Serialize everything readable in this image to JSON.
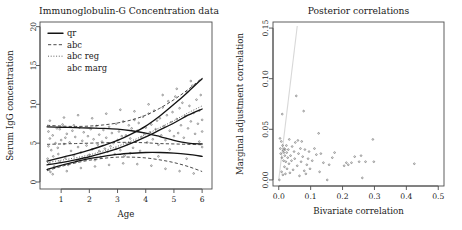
{
  "figure": {
    "background": "#ffffff",
    "axis_color": "#4d4d4d",
    "point_color": "#555555",
    "curve_color": "#141414",
    "faint_line_color": "#d8d8d8"
  },
  "chart_data": [
    {
      "type": "scatter",
      "title": "Immunoglobulin-G Concentration data",
      "xlabel": "Age",
      "ylabel": "Serum IgG concentration",
      "xlim": [
        0.25,
        6.35
      ],
      "ylim": [
        -0.9,
        20.6
      ],
      "xticks": [
        "1",
        "2",
        "3",
        "4",
        "5",
        "6"
      ],
      "xtick_values": [
        1,
        2,
        3,
        4,
        5,
        6
      ],
      "yticks": [
        "0",
        "5",
        "10",
        "15",
        "20"
      ],
      "ytick_values": [
        0,
        5,
        10,
        15,
        20
      ],
      "grid": false,
      "legend_position": "top-left",
      "legend": [
        {
          "label": "qr",
          "style": "solid"
        },
        {
          "label": "abc",
          "style": "dashed"
        },
        {
          "label": "abc reg",
          "style": "dotted"
        },
        {
          "label": "abc marg",
          "style": "none"
        }
      ],
      "series": [
        {
          "name": "qr upper quantile",
          "style": "solid",
          "x": [
            0.5,
            1.0,
            1.5,
            2.0,
            2.5,
            3.0,
            3.5,
            4.0,
            4.5,
            5.0,
            5.5,
            6.0
          ],
          "values": [
            2.7,
            3.15,
            3.6,
            4.1,
            4.7,
            5.35,
            6.2,
            7.2,
            8.5,
            10.0,
            11.6,
            13.3
          ]
        },
        {
          "name": "qr median",
          "style": "solid",
          "x": [
            0.5,
            1.0,
            1.5,
            2.0,
            2.5,
            3.0,
            3.5,
            4.0,
            4.5,
            5.0,
            5.5,
            6.0
          ],
          "values": [
            2.2,
            2.5,
            2.85,
            3.25,
            3.75,
            4.3,
            5.0,
            5.8,
            6.7,
            7.6,
            8.6,
            9.4
          ]
        },
        {
          "name": "qr upper flat",
          "style": "solid",
          "x": [
            0.5,
            1.0,
            1.5,
            2.0,
            2.5,
            3.0,
            3.5,
            4.0,
            4.5,
            5.0,
            5.5,
            6.0
          ],
          "values": [
            7.1,
            7.05,
            7.0,
            6.95,
            6.9,
            6.8,
            6.6,
            6.3,
            5.85,
            5.35,
            5.0,
            4.9
          ]
        },
        {
          "name": "qr lower flat",
          "style": "solid",
          "x": [
            0.5,
            1.0,
            1.5,
            2.0,
            2.5,
            3.0,
            3.5,
            4.0,
            4.5,
            5.0,
            5.5,
            6.0
          ],
          "values": [
            1.6,
            2.15,
            2.6,
            3.0,
            3.3,
            3.55,
            3.7,
            3.8,
            3.8,
            3.72,
            3.55,
            3.3
          ]
        },
        {
          "name": "abc upper band",
          "style": "dashed",
          "x": [
            0.5,
            1.0,
            1.5,
            2.0,
            2.5,
            3.0,
            3.5,
            4.0,
            4.5,
            5.0,
            5.5,
            6.0
          ],
          "values": [
            7.3,
            7.2,
            7.15,
            7.2,
            7.35,
            7.6,
            8.0,
            8.6,
            9.5,
            10.6,
            11.9,
            13.4
          ]
        },
        {
          "name": "abc mid band",
          "style": "dashed",
          "x": [
            0.5,
            1.0,
            1.5,
            2.0,
            2.5,
            3.0,
            3.5,
            4.0,
            4.5,
            5.0,
            5.5,
            6.0
          ],
          "values": [
            4.85,
            4.9,
            4.95,
            5.0,
            5.05,
            5.1,
            5.1,
            5.05,
            4.95,
            4.9,
            4.85,
            4.8
          ]
        },
        {
          "name": "abc lower band",
          "style": "dashed",
          "x": [
            0.5,
            1.0,
            1.5,
            2.0,
            2.5,
            3.0,
            3.5,
            4.0,
            4.5,
            5.0,
            5.5,
            6.0
          ],
          "values": [
            1.45,
            2.0,
            2.45,
            2.8,
            3.05,
            3.2,
            3.2,
            3.1,
            2.85,
            2.5,
            2.0,
            1.35
          ]
        },
        {
          "name": "abc reg band",
          "style": "dotted",
          "x": [
            0.5,
            1.0,
            1.5,
            2.0,
            2.5,
            3.0,
            3.5,
            4.0,
            4.5,
            5.0,
            5.5,
            6.0
          ],
          "values": [
            2.5,
            2.8,
            3.1,
            3.5,
            4.0,
            4.6,
            5.3,
            6.1,
            7.0,
            7.9,
            8.9,
            9.8
          ]
        }
      ],
      "points": [
        [
          0.52,
          3.0
        ],
        [
          0.55,
          4.6
        ],
        [
          0.58,
          2.4
        ],
        [
          0.6,
          5.6
        ],
        [
          0.62,
          1.3
        ],
        [
          0.65,
          4.1
        ],
        [
          0.7,
          6.0
        ],
        [
          0.72,
          3.3
        ],
        [
          0.75,
          2.0
        ],
        [
          0.8,
          5.0
        ],
        [
          0.85,
          6.9
        ],
        [
          0.88,
          4.4
        ],
        [
          0.9,
          3.6
        ],
        [
          0.95,
          2.6
        ],
        [
          1.0,
          5.4
        ],
        [
          1.05,
          7.4
        ],
        [
          1.1,
          4.9
        ],
        [
          1.15,
          3.1
        ],
        [
          1.2,
          6.2
        ],
        [
          1.25,
          2.2
        ],
        [
          1.3,
          5.1
        ],
        [
          1.35,
          4.0
        ],
        [
          1.4,
          6.6
        ],
        [
          1.45,
          3.4
        ],
        [
          1.5,
          5.8
        ],
        [
          1.55,
          2.7
        ],
        [
          1.6,
          4.5
        ],
        [
          1.65,
          7.0
        ],
        [
          1.7,
          3.8
        ],
        [
          1.75,
          5.3
        ],
        [
          1.8,
          6.4
        ],
        [
          1.85,
          2.9
        ],
        [
          1.9,
          4.7
        ],
        [
          1.95,
          5.9
        ],
        [
          2.0,
          3.5
        ],
        [
          2.05,
          6.8
        ],
        [
          2.1,
          4.2
        ],
        [
          2.15,
          5.5
        ],
        [
          2.2,
          2.8
        ],
        [
          2.25,
          7.2
        ],
        [
          2.3,
          4.8
        ],
        [
          2.35,
          6.1
        ],
        [
          2.4,
          3.2
        ],
        [
          2.45,
          5.2
        ],
        [
          2.5,
          6.7
        ],
        [
          2.55,
          4.3
        ],
        [
          2.6,
          5.7
        ],
        [
          2.65,
          3.9
        ],
        [
          2.7,
          7.1
        ],
        [
          2.75,
          4.6
        ],
        [
          2.8,
          6.3
        ],
        [
          2.85,
          5.0
        ],
        [
          2.9,
          3.6
        ],
        [
          2.95,
          7.5
        ],
        [
          3.0,
          5.4
        ],
        [
          3.05,
          6.5
        ],
        [
          3.1,
          4.1
        ],
        [
          3.15,
          5.9
        ],
        [
          3.2,
          7.8
        ],
        [
          3.25,
          3.4
        ],
        [
          3.3,
          6.0
        ],
        [
          3.35,
          4.9
        ],
        [
          3.4,
          7.3
        ],
        [
          3.45,
          5.6
        ],
        [
          3.5,
          6.9
        ],
        [
          3.55,
          4.4
        ],
        [
          3.6,
          8.0
        ],
        [
          3.65,
          5.2
        ],
        [
          3.7,
          6.6
        ],
        [
          3.75,
          7.6
        ],
        [
          3.8,
          4.0
        ],
        [
          3.85,
          5.8
        ],
        [
          3.9,
          8.4
        ],
        [
          3.95,
          6.2
        ],
        [
          4.0,
          7.0
        ],
        [
          4.05,
          5.1
        ],
        [
          4.1,
          8.8
        ],
        [
          4.15,
          6.4
        ],
        [
          4.2,
          7.4
        ],
        [
          4.25,
          5.5
        ],
        [
          4.3,
          9.2
        ],
        [
          4.35,
          6.8
        ],
        [
          4.4,
          7.9
        ],
        [
          4.45,
          4.8
        ],
        [
          4.5,
          8.2
        ],
        [
          4.55,
          6.0
        ],
        [
          4.6,
          9.6
        ],
        [
          4.65,
          7.2
        ],
        [
          4.7,
          5.4
        ],
        [
          4.75,
          8.6
        ],
        [
          4.8,
          10.4
        ],
        [
          4.85,
          6.6
        ],
        [
          4.9,
          7.7
        ],
        [
          4.95,
          9.0
        ],
        [
          5.0,
          5.9
        ],
        [
          5.05,
          11.0
        ],
        [
          5.1,
          8.1
        ],
        [
          5.15,
          6.3
        ],
        [
          5.2,
          9.5
        ],
        [
          5.25,
          7.3
        ],
        [
          5.3,
          10.2
        ],
        [
          5.35,
          5.7
        ],
        [
          5.4,
          8.5
        ],
        [
          5.45,
          11.6
        ],
        [
          5.5,
          6.9
        ],
        [
          5.55,
          9.8
        ],
        [
          5.6,
          7.8
        ],
        [
          5.65,
          12.4
        ],
        [
          5.7,
          8.9
        ],
        [
          5.75,
          6.2
        ],
        [
          5.8,
          10.6
        ],
        [
          5.85,
          7.5
        ],
        [
          5.9,
          9.2
        ],
        [
          5.95,
          11.2
        ],
        [
          6.0,
          8.0
        ],
        [
          0.6,
          7.9
        ],
        [
          1.1,
          8.3
        ],
        [
          1.6,
          8.6
        ],
        [
          2.1,
          8.2
        ],
        [
          2.6,
          8.8
        ],
        [
          3.1,
          9.3
        ],
        [
          3.6,
          9.1
        ],
        [
          4.1,
          10.0
        ],
        [
          4.6,
          11.2
        ],
        [
          5.1,
          12.0
        ],
        [
          5.6,
          13.0
        ],
        [
          0.7,
          1.0
        ],
        [
          1.2,
          1.4
        ],
        [
          1.7,
          1.8
        ],
        [
          2.2,
          2.0
        ],
        [
          2.7,
          2.2
        ],
        [
          3.2,
          2.4
        ],
        [
          3.7,
          2.3
        ],
        [
          4.2,
          2.1
        ],
        [
          4.7,
          1.7
        ],
        [
          5.2,
          1.4
        ],
        [
          5.7,
          1.1
        ],
        [
          6.0,
          6.5
        ],
        [
          6.0,
          4.5
        ],
        [
          5.9,
          5.2
        ],
        [
          0.55,
          6.5
        ],
        [
          0.95,
          6.8
        ],
        [
          1.45,
          7.3
        ],
        [
          2.95,
          4.3
        ],
        [
          3.45,
          3.7
        ],
        [
          4.45,
          3.3
        ],
        [
          5.45,
          3.0
        ],
        [
          1.15,
          5.7
        ],
        [
          2.35,
          4.0
        ],
        [
          4.85,
          4.2
        ]
      ]
    },
    {
      "type": "scatter",
      "title": "Posterior correlations",
      "xlabel": "Bivariate correlation",
      "ylabel": "Marginal adjustment correlation",
      "xlim": [
        -0.018,
        0.518
      ],
      "ylim": [
        -0.006,
        0.156
      ],
      "xticks": [
        "0.0",
        "0.1",
        "0.2",
        "0.3",
        "0.4",
        "0.5"
      ],
      "xtick_values": [
        0.0,
        0.1,
        0.2,
        0.3,
        0.4,
        0.5
      ],
      "yticks": [
        "0.00",
        "0.05",
        "0.10",
        "0.15"
      ],
      "ytick_values": [
        0.0,
        0.05,
        0.1,
        0.15
      ],
      "grid": false,
      "reference_line": {
        "style": "faint-diagonal",
        "x": [
          0.0,
          0.058
        ],
        "y": [
          0.0,
          0.152
        ]
      },
      "points": [
        [
          0.002,
          0.0
        ],
        [
          0.004,
          0.041
        ],
        [
          0.005,
          0.031
        ],
        [
          0.006,
          0.026
        ],
        [
          0.008,
          0.038
        ],
        [
          0.009,
          0.008
        ],
        [
          0.01,
          0.022
        ],
        [
          0.011,
          0.065
        ],
        [
          0.012,
          0.034
        ],
        [
          0.013,
          0.005
        ],
        [
          0.014,
          0.029
        ],
        [
          0.015,
          0.019
        ],
        [
          0.016,
          0.027
        ],
        [
          0.017,
          0.031
        ],
        [
          0.018,
          0.013
        ],
        [
          0.019,
          0.024
        ],
        [
          0.02,
          0.03
        ],
        [
          0.021,
          0.006
        ],
        [
          0.022,
          0.018
        ],
        [
          0.024,
          0.034
        ],
        [
          0.025,
          0.027
        ],
        [
          0.026,
          0.011
        ],
        [
          0.028,
          0.022
        ],
        [
          0.03,
          0.03
        ],
        [
          0.032,
          0.016
        ],
        [
          0.033,
          0.04
        ],
        [
          0.035,
          0.007
        ],
        [
          0.037,
          0.024
        ],
        [
          0.04,
          0.019
        ],
        [
          0.042,
          0.033
        ],
        [
          0.045,
          0.01
        ],
        [
          0.048,
          0.028
        ],
        [
          0.05,
          0.021
        ],
        [
          0.052,
          0.037
        ],
        [
          0.055,
          0.083
        ],
        [
          0.058,
          0.014
        ],
        [
          0.06,
          0.039
        ],
        [
          0.062,
          0.026
        ],
        [
          0.065,
          0.004
        ],
        [
          0.068,
          0.031
        ],
        [
          0.07,
          0.018
        ],
        [
          0.072,
          0.038
        ],
        [
          0.075,
          0.023
        ],
        [
          0.078,
          0.068
        ],
        [
          0.08,
          0.009
        ],
        [
          0.082,
          0.03
        ],
        [
          0.085,
          0.006
        ],
        [
          0.088,
          0.015
        ],
        [
          0.092,
          0.021
        ],
        [
          0.095,
          0.028
        ],
        [
          0.098,
          0.011
        ],
        [
          0.105,
          0.019
        ],
        [
          0.112,
          0.031
        ],
        [
          0.118,
          0.025
        ],
        [
          0.125,
          0.046
        ],
        [
          0.128,
          0.008
        ],
        [
          0.132,
          0.026
        ],
        [
          0.14,
          0.017
        ],
        [
          0.152,
          0.0
        ],
        [
          0.158,
          0.015
        ],
        [
          0.168,
          0.022
        ],
        [
          0.175,
          0.027
        ],
        [
          0.205,
          0.014
        ],
        [
          0.212,
          0.017
        ],
        [
          0.218,
          0.015
        ],
        [
          0.228,
          0.017
        ],
        [
          0.238,
          0.023
        ],
        [
          0.252,
          0.018
        ],
        [
          0.258,
          0.024
        ],
        [
          0.262,
          0.002
        ],
        [
          0.272,
          0.018
        ],
        [
          0.295,
          0.04
        ],
        [
          0.298,
          0.018
        ],
        [
          0.425,
          0.016
        ]
      ]
    }
  ]
}
